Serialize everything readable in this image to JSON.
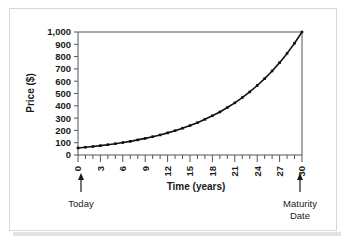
{
  "figure": {
    "background_color": "#ffffff",
    "border_color": "#d8d8d8",
    "line_color": "#111111",
    "axis_color": "#555555"
  },
  "chart_data": {
    "type": "line",
    "title": "",
    "subtitle": "",
    "xlabel": "Time (years)",
    "ylabel": "Price ($)",
    "xlim": [
      0,
      30
    ],
    "ylim": [
      0,
      1000
    ],
    "grid": false,
    "legend": "none",
    "marker": "square",
    "x_tick_labels": [
      "0",
      "3",
      "6",
      "9",
      "12",
      "15",
      "18",
      "21",
      "24",
      "27",
      "30"
    ],
    "x_tick_values": [
      0,
      3,
      6,
      9,
      12,
      15,
      18,
      21,
      24,
      27,
      30
    ],
    "x_minor_tick_interval": 1,
    "y_tick_labels": [
      "0",
      "100",
      "200",
      "300",
      "400",
      "500",
      "600",
      "700",
      "800",
      "900",
      "1,000"
    ],
    "y_tick_values": [
      0,
      100,
      200,
      300,
      400,
      500,
      600,
      700,
      800,
      900,
      1000
    ],
    "x": [
      0,
      1,
      2,
      3,
      4,
      5,
      6,
      7,
      8,
      9,
      10,
      11,
      12,
      13,
      14,
      15,
      16,
      17,
      18,
      19,
      20,
      21,
      22,
      23,
      24,
      25,
      26,
      27,
      28,
      29,
      30
    ],
    "series": [
      {
        "name": "Zero-coupon bond price",
        "values": [
          57,
          63,
          69,
          76,
          84,
          92,
          101,
          111,
          123,
          135,
          149,
          163,
          180,
          198,
          218,
          239,
          263,
          290,
          319,
          350,
          386,
          424,
          467,
          513,
          565,
          621,
          683,
          751,
          826,
          909,
          1000
        ]
      }
    ],
    "annotations": [
      {
        "x": 0,
        "label": "Today",
        "marker": "up-arrow"
      },
      {
        "x": 30,
        "label": "Maturity Date",
        "label_line_1": "Maturity",
        "label_line_2": "Date",
        "marker": "up-arrow"
      }
    ]
  }
}
